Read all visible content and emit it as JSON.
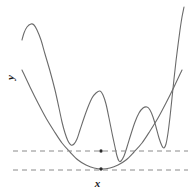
{
  "figure": {
    "name": "multimodal-function-with-convex-envelope",
    "background": "#ffffff",
    "width": 195,
    "height": 193
  },
  "axes": {
    "y_label": "y",
    "x_label": "x",
    "y_label_rotation_deg": -90
  },
  "colors": {
    "curve": "#6b6b6b",
    "curve_dark": "#555555",
    "dashed_line": "#8a8a8a",
    "marker": "#2b2b2b",
    "label_text": "#1a1a1a",
    "background": "#ffffff"
  },
  "chart_data": {
    "type": "line",
    "title": "",
    "xlabel": "x",
    "ylabel": "y",
    "grid": false,
    "legend": null,
    "xlim": [
      0,
      195
    ],
    "ylim": [
      193,
      0
    ],
    "note": "Pixel-space coordinates; y axis inverted (screen coords). Two curves: an oscillating multimodal objective and a smooth convex parabola tangent to its lower envelope.",
    "series": [
      {
        "name": "multimodal-objective",
        "style": "solid",
        "color": "#6b6b6b",
        "width": 1.1,
        "points": [
          [
            22,
            40
          ],
          [
            24,
            33
          ],
          [
            27,
            27
          ],
          [
            31,
            24
          ],
          [
            34,
            25
          ],
          [
            37,
            30
          ],
          [
            41,
            40
          ],
          [
            45,
            54
          ],
          [
            50,
            71
          ],
          [
            55,
            90
          ],
          [
            59,
            108
          ],
          [
            62,
            122
          ],
          [
            65,
            133
          ],
          [
            68,
            141
          ],
          [
            71,
            145
          ],
          [
            74,
            144
          ],
          [
            77,
            139
          ],
          [
            80,
            130
          ],
          [
            84,
            118
          ],
          [
            88,
            107
          ],
          [
            92,
            98
          ],
          [
            96,
            93
          ],
          [
            100,
            91
          ],
          [
            103,
            95
          ],
          [
            106,
            104
          ],
          [
            109,
            118
          ],
          [
            112,
            133
          ],
          [
            115,
            147
          ],
          [
            117,
            156
          ],
          [
            119,
            161
          ],
          [
            121,
            161
          ],
          [
            124,
            156
          ],
          [
            127,
            147
          ],
          [
            131,
            134
          ],
          [
            135,
            122
          ],
          [
            139,
            113
          ],
          [
            143,
            108
          ],
          [
            147,
            107
          ],
          [
            150,
            110
          ],
          [
            153,
            117
          ],
          [
            156,
            127
          ],
          [
            159,
            138
          ],
          [
            162,
            146
          ],
          [
            164,
            148
          ],
          [
            166,
            144
          ],
          [
            168,
            133
          ],
          [
            170,
            117
          ],
          [
            172,
            98
          ],
          [
            174,
            79
          ],
          [
            176,
            61
          ],
          [
            178,
            45
          ],
          [
            180,
            30
          ],
          [
            182,
            17
          ],
          [
            184,
            7
          ]
        ]
      },
      {
        "name": "convex-parabola-envelope",
        "style": "solid",
        "color": "#6b6b6b",
        "width": 1.1,
        "points": [
          [
            22,
            70
          ],
          [
            30,
            87
          ],
          [
            38,
            103
          ],
          [
            46,
            118
          ],
          [
            54,
            131
          ],
          [
            62,
            143
          ],
          [
            70,
            152
          ],
          [
            78,
            160
          ],
          [
            86,
            165
          ],
          [
            94,
            168
          ],
          [
            102,
            169
          ],
          [
            110,
            168
          ],
          [
            118,
            165
          ],
          [
            126,
            160
          ],
          [
            134,
            152
          ],
          [
            142,
            143
          ],
          [
            150,
            131
          ],
          [
            158,
            118
          ],
          [
            166,
            103
          ],
          [
            174,
            87
          ],
          [
            182,
            70
          ]
        ]
      }
    ],
    "reference_lines": [
      {
        "name": "upper-dashed-line",
        "orientation": "horizontal",
        "y": 151,
        "x_start": 13,
        "x_end": 188,
        "style": "dashed",
        "color": "#8a8a8a"
      },
      {
        "name": "lower-dashed-line",
        "orientation": "horizontal",
        "y": 170,
        "x_start": 13,
        "x_end": 188,
        "style": "dashed",
        "color": "#8a8a8a"
      }
    ],
    "markers": [
      {
        "name": "global-minimum-marker",
        "x": 101,
        "y": 151,
        "color": "#2b2b2b",
        "r": 1.7
      },
      {
        "name": "parabola-vertex-marker",
        "x": 101,
        "y": 169,
        "color": "#2b2b2b",
        "r": 1.7
      }
    ]
  }
}
